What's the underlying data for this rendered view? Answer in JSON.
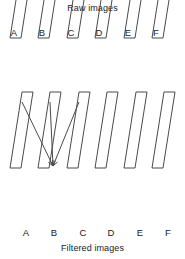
{
  "figure": {
    "title_top": "Raw images",
    "title_bottom": "Filtered images",
    "background_color": "#ffffff",
    "stroke_color": "#4a4a4a",
    "text_color": "#1a1a1a"
  },
  "rows": {
    "top": {
      "caption": "Raw images",
      "label_position": "above-left",
      "items": [
        {
          "label": "A",
          "x": 10,
          "y": 38,
          "label_x": 14,
          "label_y": 36
        },
        {
          "label": "B",
          "x": 38,
          "y": 38,
          "label_x": 42,
          "label_y": 36
        },
        {
          "label": "C",
          "x": 67,
          "y": 38,
          "label_x": 71,
          "label_y": 36
        },
        {
          "label": "D",
          "x": 95,
          "y": 38,
          "label_x": 99,
          "label_y": 36
        },
        {
          "label": "E",
          "x": 124,
          "y": 38,
          "label_x": 128,
          "label_y": 36
        },
        {
          "label": "F",
          "x": 152,
          "y": 38,
          "label_x": 156,
          "label_y": 36
        }
      ]
    },
    "bottom": {
      "caption": "Filtered images",
      "label_position": "below-right",
      "items": [
        {
          "label": "A",
          "x": 10,
          "y": 168,
          "label_x": 26,
          "label_y": 236
        },
        {
          "label": "B",
          "x": 38,
          "y": 168,
          "label_x": 54,
          "label_y": 236
        },
        {
          "label": "C",
          "x": 67,
          "y": 168,
          "label_x": 83,
          "label_y": 236
        },
        {
          "label": "D",
          "x": 95,
          "y": 168,
          "label_x": 111,
          "label_y": 236
        },
        {
          "label": "E",
          "x": 124,
          "y": 168,
          "label_x": 140,
          "label_y": 236
        },
        {
          "label": "F",
          "x": 152,
          "y": 168,
          "label_x": 168,
          "label_y": 236
        }
      ]
    }
  },
  "parallelogram": {
    "width": 11,
    "height": 76,
    "shear": 12,
    "note": "bottom-left origin; top edge shifted right by shear"
  },
  "arrows": {
    "target": {
      "x": 53,
      "y": 166
    },
    "sources": [
      {
        "from_label": "A",
        "x": 22,
        "y": 102
      },
      {
        "from_label": "B",
        "x": 50,
        "y": 102
      },
      {
        "from_label": "C",
        "x": 79,
        "y": 102
      }
    ]
  }
}
